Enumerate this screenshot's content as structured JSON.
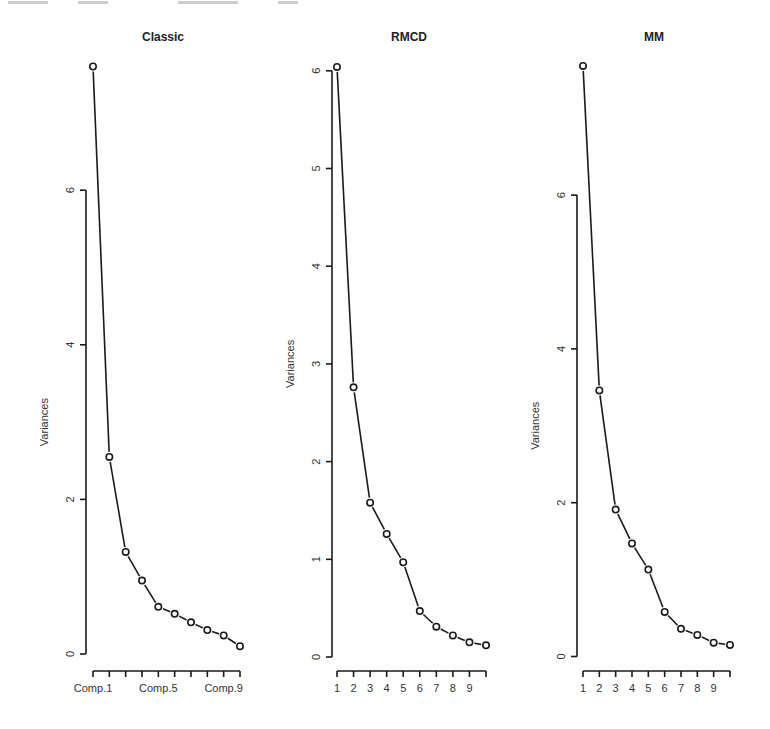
{
  "figure": {
    "y_axis_title": "Variances"
  },
  "chart_data": [
    {
      "type": "line",
      "title": "Classic",
      "xlabel": "",
      "ylabel": "Variances",
      "x": [
        1,
        2,
        3,
        4,
        5,
        6,
        7,
        8,
        9,
        10
      ],
      "x_tick_labels": [
        "Comp.1",
        "",
        "",
        "",
        "Comp.5",
        "",
        "",
        "",
        "Comp.9",
        ""
      ],
      "values": [
        7.6,
        2.55,
        1.32,
        0.95,
        0.61,
        0.52,
        0.41,
        0.31,
        0.24,
        0.1
      ],
      "y_ticks": [
        0,
        2,
        4,
        6
      ],
      "ylim": [
        0,
        7.6
      ],
      "grid": false,
      "legend": null,
      "markers": "open-circle"
    },
    {
      "type": "line",
      "title": "RMCD",
      "xlabel": "",
      "ylabel": "Variances",
      "x": [
        1,
        2,
        3,
        4,
        5,
        6,
        7,
        8,
        9,
        10
      ],
      "x_tick_labels": [
        "1",
        "2",
        "3",
        "4",
        "5",
        "6",
        "7",
        "8",
        "9",
        ""
      ],
      "values": [
        6.04,
        2.76,
        1.58,
        1.26,
        0.97,
        0.47,
        0.31,
        0.22,
        0.15,
        0.12
      ],
      "y_ticks": [
        0,
        1,
        2,
        3,
        4,
        5,
        6
      ],
      "ylim": [
        0,
        6.04
      ],
      "grid": false,
      "legend": null,
      "markers": "open-circle"
    },
    {
      "type": "line",
      "title": "MM",
      "xlabel": "",
      "ylabel": "Variances",
      "x": [
        1,
        2,
        3,
        4,
        5,
        6,
        7,
        8,
        9,
        10
      ],
      "x_tick_labels": [
        "1",
        "2",
        "3",
        "4",
        "5",
        "6",
        "7",
        "8",
        "9",
        ""
      ],
      "values": [
        7.68,
        3.46,
        1.91,
        1.47,
        1.13,
        0.58,
        0.36,
        0.28,
        0.18,
        0.15
      ],
      "y_ticks": [
        0,
        2,
        4,
        6
      ],
      "ylim": [
        0,
        7.68
      ],
      "grid": false,
      "legend": null,
      "markers": "open-circle"
    }
  ],
  "layout": {
    "panels": [
      {
        "y_axis_x": 86,
        "x_start": 93,
        "x_end": 240,
        "y_zero": 654,
        "px_per_unit": 77.3,
        "title_x": 163,
        "title_y": 41,
        "ytitle_x": 45,
        "ytick_label_x": 71
      },
      {
        "y_axis_x": 332,
        "x_start": 337,
        "x_end": 486,
        "y_zero": 657,
        "px_per_unit": 97.7,
        "title_x": 409,
        "title_y": 41,
        "ytitle_x": 291,
        "ytick_label_x": 317
      },
      {
        "y_axis_x": 577,
        "x_start": 583,
        "x_end": 730,
        "y_zero": 656.5,
        "px_per_unit": 76.9,
        "title_x": 654,
        "title_y": 41,
        "ytitle_x": 536,
        "ytick_label_x": 562
      }
    ],
    "x_axis_y": 671,
    "x_label_y": 692
  }
}
